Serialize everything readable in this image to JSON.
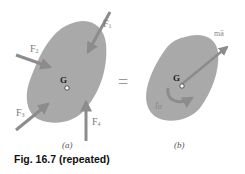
{
  "figure": {
    "caption": "Fig. 16.7 (repeated)",
    "panel_a": {
      "label": "(a)",
      "center_label": "G",
      "forces": [
        {
          "name": "F1",
          "text": "F",
          "sub": "1"
        },
        {
          "name": "F2",
          "text": "F",
          "sub": "2"
        },
        {
          "name": "F3",
          "text": "F",
          "sub": "3"
        },
        {
          "name": "F4",
          "text": "F",
          "sub": "4"
        }
      ]
    },
    "equals": "=",
    "panel_b": {
      "label": "(b)",
      "center_label": "G",
      "vector_label": "mā",
      "couple_label": "Īα"
    }
  },
  "colors": {
    "body_fill": "#a9a9a9",
    "arrow": "#8c8c8c",
    "label": "#7a7a7a"
  }
}
